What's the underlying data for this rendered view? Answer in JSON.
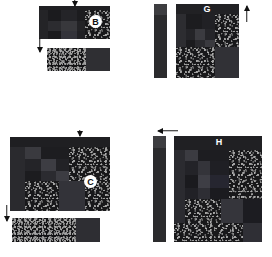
{
  "figure": {
    "background": "#ffffff",
    "panels": [
      {
        "id": "B",
        "label": "B",
        "label_style": "circled-badge",
        "position": "top-left",
        "main_rect": {
          "x": 39,
          "y": 6,
          "w": 71,
          "h": 33
        },
        "strip_rect": {
          "x": 47,
          "y": 48,
          "w": 63,
          "h": 23
        },
        "markers": [
          {
            "name": "top-tick-marker",
            "direction": "down",
            "x": 71,
            "y": 0,
            "w": 7,
            "h": 6
          },
          {
            "name": "left-down-arrow",
            "direction": "down",
            "x": 36,
            "y": 38,
            "w": 7,
            "h": 14
          }
        ]
      },
      {
        "id": "G",
        "label": "G",
        "label_style": "plain-white",
        "position": "top-right",
        "main_rect": {
          "x": 176,
          "y": 4,
          "w": 63,
          "h": 74
        },
        "sidebar_rect": {
          "x": 154,
          "y": 4,
          "w": 13,
          "h": 74
        },
        "sidebar_cap_h": 11,
        "markers": [
          {
            "name": "right-up-arrow",
            "direction": "up",
            "x": 243,
            "y": 6,
            "w": 7,
            "h": 16
          }
        ]
      },
      {
        "id": "C",
        "label": "C",
        "label_style": "circled-badge",
        "position": "bottom-left",
        "main_rect": {
          "x": 10,
          "y": 137,
          "w": 100,
          "h": 74
        },
        "strip_rect": {
          "x": 12,
          "y": 218,
          "w": 88,
          "h": 24
        },
        "markers": [
          {
            "name": "top-tick-marker",
            "direction": "down",
            "x": 76,
            "y": 130,
            "w": 7,
            "h": 6
          },
          {
            "name": "left-down-arrow",
            "direction": "down",
            "x": 3,
            "y": 205,
            "w": 7,
            "h": 16
          }
        ]
      },
      {
        "id": "H",
        "label": "H",
        "label_style": "plain-white",
        "position": "bottom-right",
        "main_rect": {
          "x": 174,
          "y": 136,
          "w": 88,
          "h": 106
        },
        "sidebar_rect": {
          "x": 153,
          "y": 136,
          "w": 13,
          "h": 106
        },
        "sidebar_cap_h": 12,
        "markers": [
          {
            "name": "top-left-arrow",
            "direction": "left",
            "x": 158,
            "y": 127,
            "w": 20,
            "h": 7
          }
        ]
      }
    ],
    "colors": {
      "background": "#ffffff",
      "label_text": "#ffffff",
      "badge_fill": "#ffffff",
      "badge_text": "#101010",
      "arrow": "#111111",
      "tile_darkest": "#141416",
      "tile_dark": "#1d1d20",
      "tile_mid": "#2a2a2d",
      "tile_light": "#3a3a3d",
      "tile_lightest": "#4a4a4e",
      "speckle_bg": "#18181a",
      "speckle_dots": "#9c9c9c",
      "sidebar": "#2b2b2d",
      "sidebar_cap": "#3d3d40"
    },
    "tiles": {
      "B": [
        {
          "name": "tile-header-band",
          "x": 0,
          "y": 0,
          "w": 100,
          "h": 12,
          "fill": "#202023",
          "type": "solid"
        },
        {
          "name": "tile-left-column",
          "x": 0,
          "y": 12,
          "w": 13,
          "h": 88,
          "fill": "#242427",
          "type": "solid"
        },
        {
          "name": "tile-upper-left",
          "x": 13,
          "y": 12,
          "w": 18,
          "h": 33,
          "fill": "#1b1b1e",
          "type": "solid"
        },
        {
          "name": "tile-upper-mid",
          "x": 31,
          "y": 12,
          "w": 22,
          "h": 33,
          "fill": "#242428",
          "type": "solid"
        },
        {
          "name": "tile-upper-right",
          "x": 53,
          "y": 12,
          "w": 12,
          "h": 33,
          "fill": "#1c1c1f",
          "type": "solid"
        },
        {
          "name": "tile-mid-left",
          "x": 13,
          "y": 45,
          "w": 18,
          "h": 30,
          "fill": "#2c2c30",
          "type": "solid"
        },
        {
          "name": "tile-mid-center",
          "x": 31,
          "y": 45,
          "w": 22,
          "h": 30,
          "fill": "#38383c",
          "type": "solid"
        },
        {
          "name": "tile-mid-right",
          "x": 53,
          "y": 45,
          "w": 12,
          "h": 30,
          "fill": "#232326",
          "type": "solid"
        },
        {
          "name": "tile-low-left",
          "x": 13,
          "y": 75,
          "w": 18,
          "h": 25,
          "fill": "#1a1a1d",
          "type": "solid"
        },
        {
          "name": "tile-low-center",
          "x": 31,
          "y": 75,
          "w": 22,
          "h": 25,
          "fill": "#33333a",
          "type": "solid"
        },
        {
          "name": "tile-low-right",
          "x": 53,
          "y": 75,
          "w": 12,
          "h": 25,
          "fill": "#202024",
          "type": "solid"
        },
        {
          "name": "tile-speckle-right",
          "x": 65,
          "y": 12,
          "w": 35,
          "h": 88,
          "fill": "#18181a",
          "type": "speckle"
        }
      ],
      "B_strip": [
        {
          "name": "strip-speckle",
          "x": 0,
          "y": 0,
          "w": 62,
          "h": 100,
          "fill": "#18181a",
          "type": "speckle"
        },
        {
          "name": "strip-solid",
          "x": 62,
          "y": 0,
          "w": 38,
          "h": 100,
          "fill": "#2f2f33",
          "type": "solid"
        }
      ],
      "G": [
        {
          "name": "tile-header-band",
          "x": 0,
          "y": 0,
          "w": 100,
          "h": 14,
          "fill": "#212124",
          "type": "solid"
        },
        {
          "name": "tile-left-column",
          "x": 0,
          "y": 14,
          "w": 16,
          "h": 44,
          "fill": "#2d2d31",
          "type": "solid"
        },
        {
          "name": "tile-upper-mid",
          "x": 16,
          "y": 14,
          "w": 26,
          "h": 20,
          "fill": "#1c1c1f",
          "type": "solid"
        },
        {
          "name": "tile-upper-right2",
          "x": 42,
          "y": 14,
          "w": 20,
          "h": 20,
          "fill": "#212125",
          "type": "solid"
        },
        {
          "name": "tile-mid-a",
          "x": 16,
          "y": 34,
          "w": 14,
          "h": 14,
          "fill": "#242428",
          "type": "solid"
        },
        {
          "name": "tile-mid-b",
          "x": 30,
          "y": 34,
          "w": 16,
          "h": 14,
          "fill": "#3b3b40",
          "type": "solid"
        },
        {
          "name": "tile-mid-c",
          "x": 46,
          "y": 34,
          "w": 16,
          "h": 14,
          "fill": "#252529",
          "type": "solid"
        },
        {
          "name": "tile-low-a",
          "x": 16,
          "y": 48,
          "w": 14,
          "h": 10,
          "fill": "#1b1b1e",
          "type": "solid"
        },
        {
          "name": "tile-low-b",
          "x": 30,
          "y": 48,
          "w": 16,
          "h": 10,
          "fill": "#2a2a2e",
          "type": "solid"
        },
        {
          "name": "tile-low-c",
          "x": 46,
          "y": 48,
          "w": 16,
          "h": 10,
          "fill": "#3a3a3f",
          "type": "solid"
        },
        {
          "name": "tile-speckle-right",
          "x": 62,
          "y": 14,
          "w": 38,
          "h": 44,
          "fill": "#18181a",
          "type": "speckle"
        },
        {
          "name": "tile-speckle-lower",
          "x": 0,
          "y": 58,
          "w": 62,
          "h": 42,
          "fill": "#18181a",
          "type": "speckle"
        },
        {
          "name": "tile-lower-right",
          "x": 62,
          "y": 58,
          "w": 38,
          "h": 42,
          "fill": "#313136",
          "type": "solid"
        }
      ],
      "C": [
        {
          "name": "tile-header-band",
          "x": 0,
          "y": 0,
          "w": 100,
          "h": 13,
          "fill": "#1f1f22",
          "type": "solid"
        },
        {
          "name": "tile-left-column",
          "x": 0,
          "y": 13,
          "w": 15,
          "h": 87,
          "fill": "#2a2a2e",
          "type": "solid"
        },
        {
          "name": "tile-upper-left",
          "x": 15,
          "y": 13,
          "w": 16,
          "h": 17,
          "fill": "#3a3a3f",
          "type": "solid"
        },
        {
          "name": "tile-upper-mid",
          "x": 31,
          "y": 13,
          "w": 28,
          "h": 17,
          "fill": "#1d1d20",
          "type": "solid"
        },
        {
          "name": "tile-mid-a",
          "x": 15,
          "y": 30,
          "w": 16,
          "h": 16,
          "fill": "#242428",
          "type": "solid"
        },
        {
          "name": "tile-mid-b",
          "x": 31,
          "y": 30,
          "w": 15,
          "h": 16,
          "fill": "#3d3d43",
          "type": "solid"
        },
        {
          "name": "tile-mid-c",
          "x": 46,
          "y": 30,
          "w": 13,
          "h": 16,
          "fill": "#222226",
          "type": "solid"
        },
        {
          "name": "tile-low-a",
          "x": 15,
          "y": 46,
          "w": 16,
          "h": 14,
          "fill": "#1c1c1f",
          "type": "solid"
        },
        {
          "name": "tile-low-b",
          "x": 31,
          "y": 46,
          "w": 15,
          "h": 14,
          "fill": "#2b2b30",
          "type": "solid"
        },
        {
          "name": "tile-low-c",
          "x": 46,
          "y": 46,
          "w": 13,
          "h": 14,
          "fill": "#3c3c42",
          "type": "solid"
        },
        {
          "name": "tile-speckle-right",
          "x": 59,
          "y": 13,
          "w": 41,
          "h": 47,
          "fill": "#18181a",
          "type": "speckle"
        },
        {
          "name": "tile-speckle-lower",
          "x": 15,
          "y": 60,
          "w": 34,
          "h": 40,
          "fill": "#18181a",
          "type": "speckle"
        },
        {
          "name": "tile-lower-mid",
          "x": 49,
          "y": 60,
          "w": 26,
          "h": 40,
          "fill": "#333339",
          "type": "solid"
        },
        {
          "name": "tile-speckle-br",
          "x": 75,
          "y": 60,
          "w": 25,
          "h": 40,
          "fill": "#16161a",
          "type": "speckle"
        }
      ],
      "C_strip": [
        {
          "name": "strip-speckle",
          "x": 0,
          "y": 0,
          "w": 73,
          "h": 100,
          "fill": "#18181a",
          "type": "speckle"
        },
        {
          "name": "strip-solid",
          "x": 73,
          "y": 0,
          "w": 27,
          "h": 100,
          "fill": "#2e2e33",
          "type": "solid"
        }
      ],
      "H": [
        {
          "name": "tile-header-band",
          "x": 0,
          "y": 0,
          "w": 100,
          "h": 13,
          "fill": "#202023",
          "type": "solid"
        },
        {
          "name": "tile-left-column",
          "x": 0,
          "y": 13,
          "w": 13,
          "h": 87,
          "fill": "#2b2b30",
          "type": "solid"
        },
        {
          "name": "tile-upper-left",
          "x": 13,
          "y": 13,
          "w": 14,
          "h": 11,
          "fill": "#3b3b41",
          "type": "solid"
        },
        {
          "name": "tile-upper-mid",
          "x": 27,
          "y": 13,
          "w": 36,
          "h": 11,
          "fill": "#1d1d21",
          "type": "solid"
        },
        {
          "name": "tile-mid-a",
          "x": 13,
          "y": 24,
          "w": 14,
          "h": 13,
          "fill": "#232328",
          "type": "solid"
        },
        {
          "name": "tile-mid-b",
          "x": 27,
          "y": 24,
          "w": 14,
          "h": 13,
          "fill": "#34343a",
          "type": "solid"
        },
        {
          "name": "tile-mid-c",
          "x": 41,
          "y": 24,
          "w": 22,
          "h": 13,
          "fill": "#1f1f24",
          "type": "solid"
        },
        {
          "name": "tile-mid-d",
          "x": 13,
          "y": 37,
          "w": 14,
          "h": 12,
          "fill": "#1a1a1e",
          "type": "solid"
        },
        {
          "name": "tile-mid-e",
          "x": 27,
          "y": 37,
          "w": 14,
          "h": 12,
          "fill": "#3e3e45",
          "type": "solid"
        },
        {
          "name": "tile-mid-f",
          "x": 41,
          "y": 37,
          "w": 22,
          "h": 12,
          "fill": "#262630",
          "type": "solid"
        },
        {
          "name": "tile-low-a",
          "x": 13,
          "y": 49,
          "w": 14,
          "h": 10,
          "fill": "#212126",
          "type": "solid"
        },
        {
          "name": "tile-low-b",
          "x": 27,
          "y": 49,
          "w": 14,
          "h": 10,
          "fill": "#2e2e34",
          "type": "solid"
        },
        {
          "name": "tile-low-c",
          "x": 41,
          "y": 49,
          "w": 22,
          "h": 10,
          "fill": "#1b1b1f",
          "type": "solid"
        },
        {
          "name": "tile-speckle-right",
          "x": 63,
          "y": 13,
          "w": 37,
          "h": 46,
          "fill": "#18181a",
          "type": "speckle"
        },
        {
          "name": "tile-speckle-lower",
          "x": 13,
          "y": 59,
          "w": 40,
          "h": 23,
          "fill": "#18181a",
          "type": "speckle"
        },
        {
          "name": "tile-lower-mid",
          "x": 53,
          "y": 59,
          "w": 25,
          "h": 23,
          "fill": "#35353b",
          "type": "solid"
        },
        {
          "name": "tile-lower-right",
          "x": 78,
          "y": 59,
          "w": 22,
          "h": 23,
          "fill": "#1c1c21",
          "type": "solid"
        },
        {
          "name": "tile-bottom-speckle",
          "x": 0,
          "y": 82,
          "w": 78,
          "h": 18,
          "fill": "#16161a",
          "type": "speckle"
        },
        {
          "name": "tile-bottom-right",
          "x": 78,
          "y": 82,
          "w": 22,
          "h": 18,
          "fill": "#2f2f35",
          "type": "solid"
        }
      ]
    }
  }
}
